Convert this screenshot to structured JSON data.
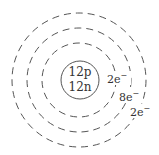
{
  "diagram": {
    "type": "bohr-model",
    "nucleus": {
      "protons": "12p",
      "neutrons": "12n"
    },
    "shells": [
      {
        "label": "2e",
        "superscript": "−"
      },
      {
        "label": "8e",
        "superscript": "−"
      },
      {
        "label": "2e",
        "superscript": "−"
      }
    ],
    "colors": {
      "stroke": "#555555",
      "text": "#333333",
      "background": "#ffffff"
    }
  }
}
